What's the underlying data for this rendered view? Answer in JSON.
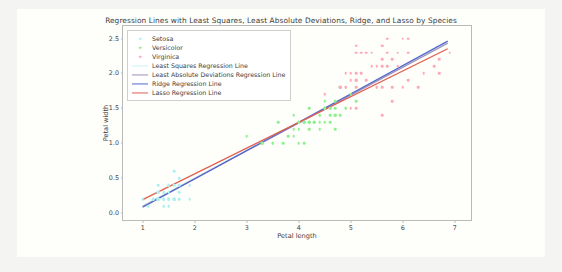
{
  "figure": {
    "background_color": "#fefefb",
    "outer_background_color": "#f4f4f2"
  },
  "chart_data": {
    "type": "scatter",
    "title": "Regression Lines with Least Squares, Least Absolute Deviations, Ridge, and Lasso by Species",
    "xlabel": "Petal length",
    "ylabel": "Petal width",
    "xlim": [
      0.62,
      7.35
    ],
    "ylim": [
      -0.13,
      2.68
    ],
    "xticks": [
      1,
      2,
      3,
      4,
      5,
      6,
      7
    ],
    "xtick_labels": [
      "1",
      "2",
      "3",
      "4",
      "5",
      "6",
      "7"
    ],
    "yticks": [
      0.0,
      0.5,
      1.0,
      1.5,
      2.0,
      2.5
    ],
    "ytick_labels": [
      "0.0",
      "0.5",
      "1.0",
      "1.5",
      "2.0",
      "2.5"
    ],
    "grid": false,
    "legend_position": "upper left",
    "series": [
      {
        "name": "Setosa",
        "kind": "scatter",
        "color": "#aef0f0",
        "points": [
          [
            1.4,
            0.2
          ],
          [
            1.4,
            0.2
          ],
          [
            1.3,
            0.2
          ],
          [
            1.5,
            0.2
          ],
          [
            1.4,
            0.2
          ],
          [
            1.7,
            0.4
          ],
          [
            1.4,
            0.3
          ],
          [
            1.5,
            0.2
          ],
          [
            1.4,
            0.2
          ],
          [
            1.5,
            0.1
          ],
          [
            1.5,
            0.2
          ],
          [
            1.6,
            0.2
          ],
          [
            1.4,
            0.1
          ],
          [
            1.1,
            0.1
          ],
          [
            1.2,
            0.2
          ],
          [
            1.5,
            0.4
          ],
          [
            1.3,
            0.4
          ],
          [
            1.4,
            0.3
          ],
          [
            1.7,
            0.3
          ],
          [
            1.5,
            0.3
          ],
          [
            1.7,
            0.2
          ],
          [
            1.5,
            0.4
          ],
          [
            1.0,
            0.2
          ],
          [
            1.7,
            0.5
          ],
          [
            1.9,
            0.2
          ],
          [
            1.6,
            0.2
          ],
          [
            1.6,
            0.4
          ],
          [
            1.5,
            0.2
          ],
          [
            1.4,
            0.2
          ],
          [
            1.6,
            0.2
          ],
          [
            1.6,
            0.2
          ],
          [
            1.5,
            0.4
          ],
          [
            1.5,
            0.1
          ],
          [
            1.4,
            0.2
          ],
          [
            1.5,
            0.2
          ],
          [
            1.2,
            0.2
          ],
          [
            1.3,
            0.2
          ],
          [
            1.4,
            0.1
          ],
          [
            1.3,
            0.2
          ],
          [
            1.5,
            0.2
          ],
          [
            1.3,
            0.3
          ],
          [
            1.3,
            0.3
          ],
          [
            1.3,
            0.2
          ],
          [
            1.6,
            0.6
          ],
          [
            1.9,
            0.4
          ],
          [
            1.4,
            0.3
          ],
          [
            1.6,
            0.2
          ],
          [
            1.4,
            0.2
          ],
          [
            1.5,
            0.2
          ],
          [
            1.4,
            0.2
          ]
        ]
      },
      {
        "name": "Versicolor",
        "kind": "scatter",
        "color": "#8ef08e",
        "points": [
          [
            4.7,
            1.4
          ],
          [
            4.5,
            1.5
          ],
          [
            4.9,
            1.5
          ],
          [
            4.0,
            1.3
          ],
          [
            4.6,
            1.5
          ],
          [
            4.5,
            1.3
          ],
          [
            4.7,
            1.6
          ],
          [
            3.3,
            1.0
          ],
          [
            4.6,
            1.3
          ],
          [
            3.9,
            1.4
          ],
          [
            3.5,
            1.0
          ],
          [
            4.2,
            1.5
          ],
          [
            4.0,
            1.0
          ],
          [
            4.7,
            1.4
          ],
          [
            3.6,
            1.3
          ],
          [
            4.4,
            1.4
          ],
          [
            4.5,
            1.5
          ],
          [
            4.1,
            1.0
          ],
          [
            4.5,
            1.5
          ],
          [
            3.9,
            1.1
          ],
          [
            4.8,
            1.8
          ],
          [
            4.0,
            1.3
          ],
          [
            4.9,
            1.5
          ],
          [
            4.7,
            1.2
          ],
          [
            4.3,
            1.3
          ],
          [
            4.4,
            1.4
          ],
          [
            4.8,
            1.4
          ],
          [
            5.0,
            1.7
          ],
          [
            4.5,
            1.5
          ],
          [
            3.5,
            1.0
          ],
          [
            3.8,
            1.1
          ],
          [
            3.7,
            1.0
          ],
          [
            3.9,
            1.2
          ],
          [
            5.1,
            1.6
          ],
          [
            4.5,
            1.5
          ],
          [
            4.5,
            1.6
          ],
          [
            4.7,
            1.5
          ],
          [
            4.4,
            1.3
          ],
          [
            4.1,
            1.3
          ],
          [
            4.0,
            1.3
          ],
          [
            4.4,
            1.2
          ],
          [
            4.6,
            1.4
          ],
          [
            4.0,
            1.2
          ],
          [
            3.3,
            1.0
          ],
          [
            4.2,
            1.3
          ],
          [
            4.2,
            1.2
          ],
          [
            4.2,
            1.3
          ],
          [
            4.3,
            1.3
          ],
          [
            3.0,
            1.1
          ],
          [
            4.1,
            1.3
          ]
        ]
      },
      {
        "name": "Virginica",
        "kind": "scatter",
        "color": "#ffa8b8",
        "points": [
          [
            6.0,
            2.5
          ],
          [
            5.1,
            1.9
          ],
          [
            5.9,
            2.1
          ],
          [
            5.6,
            1.8
          ],
          [
            5.8,
            2.2
          ],
          [
            6.6,
            2.1
          ],
          [
            4.5,
            1.7
          ],
          [
            6.3,
            1.8
          ],
          [
            5.8,
            1.8
          ],
          [
            6.1,
            2.5
          ],
          [
            5.1,
            2.0
          ],
          [
            5.3,
            1.9
          ],
          [
            5.5,
            2.1
          ],
          [
            5.0,
            2.0
          ],
          [
            5.1,
            2.4
          ],
          [
            5.3,
            2.3
          ],
          [
            5.5,
            1.8
          ],
          [
            6.7,
            2.2
          ],
          [
            6.9,
            2.3
          ],
          [
            5.0,
            1.5
          ],
          [
            5.7,
            2.3
          ],
          [
            4.9,
            2.0
          ],
          [
            6.7,
            2.0
          ],
          [
            4.9,
            1.8
          ],
          [
            5.7,
            2.1
          ],
          [
            6.0,
            1.8
          ],
          [
            4.8,
            1.8
          ],
          [
            4.9,
            1.8
          ],
          [
            5.6,
            2.1
          ],
          [
            5.8,
            1.6
          ],
          [
            6.1,
            1.9
          ],
          [
            6.4,
            2.0
          ],
          [
            5.6,
            2.2
          ],
          [
            5.1,
            1.5
          ],
          [
            5.6,
            1.4
          ],
          [
            6.1,
            2.3
          ],
          [
            5.6,
            2.4
          ],
          [
            5.5,
            1.8
          ],
          [
            4.8,
            1.8
          ],
          [
            5.4,
            2.1
          ],
          [
            5.6,
            2.4
          ],
          [
            5.1,
            2.3
          ],
          [
            5.1,
            1.9
          ],
          [
            5.9,
            2.3
          ],
          [
            5.7,
            2.5
          ],
          [
            5.2,
            2.3
          ],
          [
            5.0,
            1.9
          ],
          [
            5.2,
            2.0
          ],
          [
            5.4,
            2.3
          ],
          [
            5.1,
            1.8
          ]
        ]
      },
      {
        "name": "Least Squares Regression Line",
        "kind": "line",
        "color": "#c8f4f4",
        "endpoints": [
          [
            1.0,
            0.075
          ],
          [
            6.9,
            2.44
          ]
        ]
      },
      {
        "name": "Least Absolute Deviations Regression Line",
        "kind": "line",
        "color": "#a18fb5",
        "endpoints": [
          [
            1.0,
            0.065
          ],
          [
            6.9,
            2.43
          ]
        ]
      },
      {
        "name": "Ridge Regression Line",
        "kind": "line",
        "color": "#5566cc",
        "endpoints": [
          [
            1.0,
            0.055
          ],
          [
            6.9,
            2.46
          ]
        ]
      },
      {
        "name": "Lasso Regression Line",
        "kind": "line",
        "color": "#e06050",
        "endpoints": [
          [
            1.0,
            0.165
          ],
          [
            6.9,
            2.35
          ]
        ]
      }
    ]
  }
}
